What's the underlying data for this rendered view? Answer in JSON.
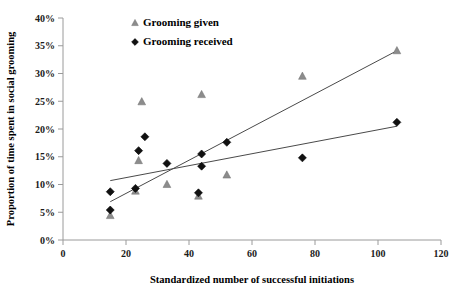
{
  "chart_data": {
    "type": "scatter",
    "title": "",
    "xlabel": "Standardized number of successful initiations",
    "ylabel": "Proportion of time spent in social grooming",
    "xlim": [
      0,
      120
    ],
    "ylim": [
      0,
      0.4
    ],
    "xticks": [
      0,
      20,
      40,
      60,
      80,
      100,
      120
    ],
    "xtick_labels": [
      "0",
      "20",
      "40",
      "60",
      "80",
      "100",
      "120"
    ],
    "yticks": [
      0,
      0.05,
      0.1,
      0.15,
      0.2,
      0.25,
      0.3,
      0.35,
      0.4
    ],
    "ytick_labels": [
      "0%",
      "5%",
      "10%",
      "15%",
      "20%",
      "25%",
      "30%",
      "35%",
      "40%"
    ],
    "grid": false,
    "legend_position": "top-center",
    "series": [
      {
        "name": "Grooming given",
        "marker": "triangle",
        "color": "#8c8c8c",
        "points": [
          {
            "x": 15,
            "y": 0.044
          },
          {
            "x": 23,
            "y": 0.088
          },
          {
            "x": 24,
            "y": 0.143
          },
          {
            "x": 25,
            "y": 0.249
          },
          {
            "x": 33,
            "y": 0.1
          },
          {
            "x": 43,
            "y": 0.079
          },
          {
            "x": 44,
            "y": 0.262
          },
          {
            "x": 52,
            "y": 0.117
          },
          {
            "x": 76,
            "y": 0.295
          },
          {
            "x": 106,
            "y": 0.341
          }
        ],
        "trend": {
          "x0": 15,
          "y0": 0.069,
          "x1": 106,
          "y1": 0.341
        }
      },
      {
        "name": "Grooming received",
        "marker": "diamond",
        "color": "#111111",
        "points": [
          {
            "x": 15,
            "y": 0.054
          },
          {
            "x": 15,
            "y": 0.087
          },
          {
            "x": 23,
            "y": 0.093
          },
          {
            "x": 24,
            "y": 0.161
          },
          {
            "x": 26,
            "y": 0.186
          },
          {
            "x": 33,
            "y": 0.138
          },
          {
            "x": 43,
            "y": 0.085
          },
          {
            "x": 44,
            "y": 0.133
          },
          {
            "x": 44,
            "y": 0.155
          },
          {
            "x": 52,
            "y": 0.176
          },
          {
            "x": 76,
            "y": 0.148
          },
          {
            "x": 106,
            "y": 0.212
          }
        ],
        "trend": {
          "x0": 15,
          "y0": 0.107,
          "x1": 106,
          "y1": 0.205
        }
      }
    ],
    "legend": [
      {
        "label": "Grooming given",
        "marker": "triangle",
        "color": "#8c8c8c"
      },
      {
        "label": "Grooming received",
        "marker": "diamond",
        "color": "#111111"
      }
    ]
  }
}
